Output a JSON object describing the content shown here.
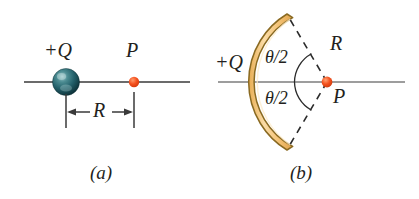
{
  "figure": {
    "background_color": "#ffffff",
    "width": 419,
    "height": 199
  },
  "colors": {
    "axis_line": "#3a3a3a",
    "axis_line_b": "#7a7a7a",
    "point_charge_dot": "#f04e23",
    "point_charge_dot_highlight": "#ffb08a",
    "sphere_dark": "#0f3a40",
    "sphere_mid": "#2f7077",
    "sphere_light": "#7fb3b8",
    "arc_fill": "#f6c878",
    "arc_fill_light": "#fbe3b3",
    "arc_stroke": "#8a6a22",
    "text": "#231f20",
    "dashed": "#2b2b2b"
  },
  "panels": [
    {
      "id": "a",
      "caption": "(a)",
      "charge_label": "+Q",
      "point_label": "P",
      "distance_label": "R",
      "charge_type": "sphere",
      "description": "A positive point charge +Q shown as a shaded sphere on a horizontal axis, with field point P a distance R to the right."
    },
    {
      "id": "b",
      "caption": "(b)",
      "charge_label": "+Q",
      "point_label": "P",
      "radius_label": "R",
      "angle_label_top": "θ/2",
      "angle_label_bottom": "θ/2",
      "charge_type": "arc",
      "description": "A positive charge +Q spread along a circular arc of radius R subtending total angle theta about the center point P, with half-angle theta/2 above and below the horizontal axis."
    }
  ]
}
